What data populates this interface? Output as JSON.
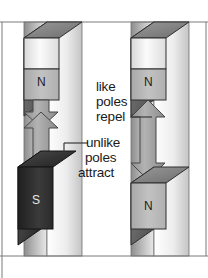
{
  "figure": {
    "kind": "physics-illustration",
    "background": "#ffffff",
    "frame_line_color": "#7a7a7a"
  },
  "annotations": {
    "repel": {
      "line1": "like",
      "line2": "poles",
      "line3": "repel",
      "meaning": "like poles repel"
    },
    "attract": {
      "line1": "unlike",
      "line2": "poles",
      "line3": "attract",
      "meaning": "unlike poles attract"
    }
  },
  "columns": [
    {
      "id": "left-column",
      "interaction": "attract",
      "arrow_direction": "converging",
      "magnets": [
        {
          "id": "left-top-magnet",
          "pole_label": "N",
          "position": "top",
          "face_shade": "light-grey"
        },
        {
          "id": "left-bottom-magnet",
          "pole_label": "S",
          "position": "bottom",
          "face_shade": "dark"
        }
      ]
    },
    {
      "id": "right-column",
      "interaction": "repel",
      "arrow_direction": "diverging",
      "magnets": [
        {
          "id": "right-top-magnet",
          "pole_label": "N",
          "position": "top",
          "face_shade": "light-grey"
        },
        {
          "id": "right-bottom-magnet",
          "pole_label": "N",
          "position": "bottom",
          "face_shade": "light-grey"
        }
      ]
    }
  ],
  "colors": {
    "arrow_fill": "#9d9d9d",
    "arrow_edge": "#4a4a4a",
    "magnet_face_light": "#bdbdbd",
    "magnet_face_dark": "#2e2e2e",
    "magnet_top_light": "#8f8f8f",
    "magnet_side": "#6b6b6b",
    "bar_light": "#f2f2f2",
    "bar_mid": "#c9c9c9",
    "outline": "#3a3a3a"
  }
}
